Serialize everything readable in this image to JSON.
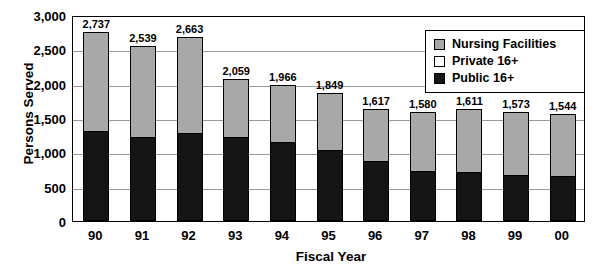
{
  "chart_data": {
    "type": "bar",
    "subtype": "stacked-column",
    "title": "",
    "xlabel": "Fiscal Year",
    "ylabel": "Persons Served",
    "categories": [
      "90",
      "91",
      "92",
      "93",
      "94",
      "95",
      "96",
      "97",
      "98",
      "99",
      "00"
    ],
    "ylim": [
      0,
      3000
    ],
    "yticks": [
      0,
      500,
      1000,
      1500,
      2000,
      2500,
      3000
    ],
    "ytick_labels": [
      "0",
      "500",
      "1,000",
      "1,500",
      "2,000",
      "2,500",
      "3,000"
    ],
    "grid": true,
    "legend_position": "top-right",
    "series": [
      {
        "name": "Public 16+",
        "color": "#151515",
        "values": [
          1290,
          1210,
          1260,
          1210,
          1130,
          1020,
          860,
          720,
          700,
          660,
          640
        ]
      },
      {
        "name": "Private 16+",
        "color": "#ffffff",
        "values": [
          0,
          0,
          0,
          0,
          0,
          0,
          0,
          0,
          0,
          0,
          0
        ]
      },
      {
        "name": "Nursing Facilities",
        "color": "#a8a8a8",
        "values": [
          1447,
          1329,
          1403,
          849,
          836,
          829,
          757,
          860,
          911,
          913,
          904
        ]
      }
    ],
    "totals": [
      2737,
      2539,
      2663,
      2059,
      1966,
      1849,
      1617,
      1580,
      1611,
      1573,
      1544
    ],
    "total_labels": [
      "2,737",
      "2,539",
      "2,663",
      "2,059",
      "1,966",
      "1,849",
      "1,617",
      "1,580",
      "1,611",
      "1,573",
      "1,544"
    ]
  },
  "legend": {
    "items": [
      {
        "label": "Nursing Facilities",
        "swatch": "#a8a8a8"
      },
      {
        "label": "Private 16+",
        "swatch": "#ffffff"
      },
      {
        "label": "Public 16+",
        "swatch": "#151515"
      }
    ]
  },
  "colors": {
    "nursing": "#a8a8a8",
    "private": "#ffffff",
    "public": "#151515",
    "axis": "#000000",
    "grid": "#9a9a9a"
  }
}
